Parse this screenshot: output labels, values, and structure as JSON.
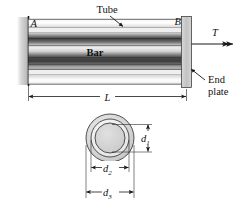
{
  "figure": {
    "labels": {
      "tube": "Tube",
      "bar": "Bar",
      "end_plate_line1": "End",
      "end_plate_line2": "plate",
      "point_a": "A",
      "point_b": "B",
      "torque": "T",
      "length": "L",
      "d1": "d",
      "d1_sub": "1",
      "d2": "d",
      "d2_sub": "2",
      "d3": "d",
      "d3_sub": "3"
    },
    "colors": {
      "line": "#1a1a1a",
      "wall_fill": "#c9c9c9",
      "tube_fill": "#e8e8e8",
      "bar_dark": "#4a4a4a",
      "bar_mid": "#8f8f8f",
      "bar_light": "#d8d8d8",
      "plate_fill": "#c4c4c4",
      "section_outer": "#d0d0d0",
      "section_mid": "#e2e2e2",
      "section_inner": "#cfcfcf",
      "background": "#ffffff"
    },
    "views": {
      "elevation": "side elevation of tube with internal bar, fixed at left wall",
      "section": "circular cross-section with three concentric diameters"
    }
  }
}
